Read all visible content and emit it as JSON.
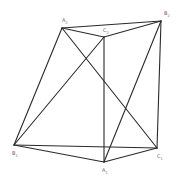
{
  "figure": {
    "type": "geometric-solid",
    "line_color": "#2a2a2a",
    "label_color": "#666666",
    "vertices": [
      {
        "id": "A2",
        "letter": "A",
        "sub": "2"
      },
      {
        "id": "B2",
        "letter": "B",
        "sub": "2"
      },
      {
        "id": "C2",
        "letter": "C",
        "sub": "2"
      },
      {
        "id": "B1",
        "letter": "B",
        "sub": "1"
      },
      {
        "id": "A1",
        "letter": "A",
        "sub": "1"
      },
      {
        "id": "C1",
        "letter": "C",
        "sub": "1"
      }
    ],
    "edges": [
      [
        "A2",
        "B2"
      ],
      [
        "A2",
        "C2"
      ],
      [
        "C2",
        "B2"
      ],
      [
        "A2",
        "B1"
      ],
      [
        "A2",
        "C1"
      ],
      [
        "C2",
        "B1"
      ],
      [
        "C2",
        "A1"
      ],
      [
        "B2",
        "A1"
      ],
      [
        "B2",
        "C1"
      ],
      [
        "B1",
        "C1"
      ],
      [
        "B1",
        "A1"
      ],
      [
        "A1",
        "C1"
      ]
    ]
  }
}
